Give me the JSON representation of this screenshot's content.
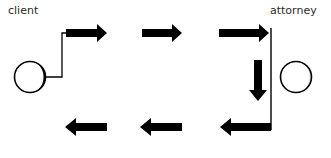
{
  "labels": {
    "client": "client",
    "attorney": "attorney"
  },
  "nodes": [
    {
      "id": "client",
      "label": "client",
      "shape": "circle"
    },
    {
      "id": "attorney",
      "label": "attorney",
      "shape": "circle"
    }
  ],
  "flow": {
    "top_row_direction": "right",
    "right_column_direction": "down",
    "bottom_row_direction": "left",
    "top_row_arrow_count": 3,
    "bottom_row_arrow_count": 3
  },
  "colors": {
    "stroke": "#000000",
    "background": "#ffffff",
    "text": "#2a2a2a"
  }
}
